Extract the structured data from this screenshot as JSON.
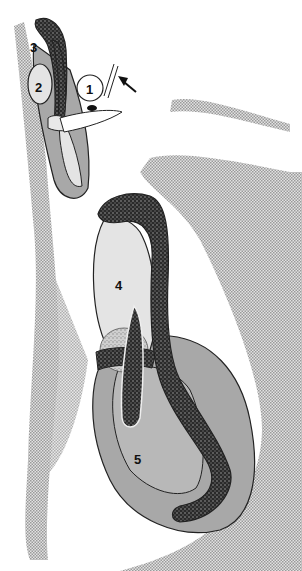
{
  "figure": {
    "type": "anatomical cross-section diagram",
    "labels": [
      {
        "id": "1",
        "text": "1"
      },
      {
        "id": "2",
        "text": "2"
      },
      {
        "id": "3",
        "text": "3"
      },
      {
        "id": "4",
        "text": "4"
      },
      {
        "id": "5",
        "text": "5"
      }
    ],
    "annotations": {
      "arrow": "arrow pointing to structure 1"
    },
    "colors": {
      "stipple_background": "#c8c8c8",
      "dark_tissue": "#3a3a3a",
      "light_organ": "#e4e4e4",
      "mid_organ": "#a8a8a8",
      "outline": "#222222"
    }
  }
}
